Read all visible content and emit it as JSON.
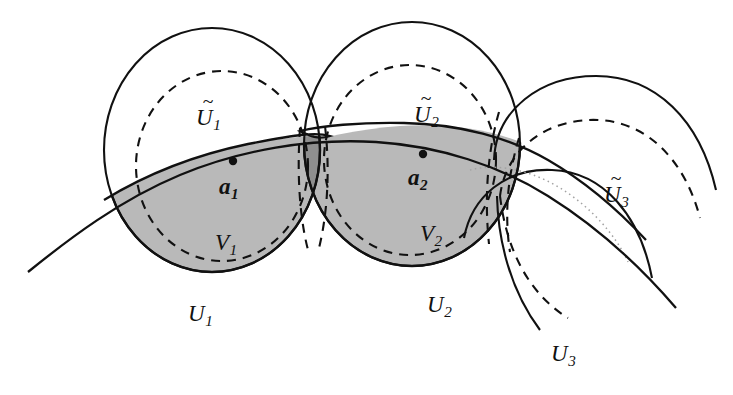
{
  "figure": {
    "background_color": "#ffffff",
    "stroke_color": "#111111",
    "fill_light_gray": "#b9b9b9",
    "fill_dark_gray": "#8e8e8e",
    "dotted_gray": "#9a9a9a"
  },
  "labels": [
    {
      "id": "U1tilde",
      "base": "U",
      "tilde": "~",
      "sub": "1",
      "x": 196,
      "y": 106,
      "has_tilde": true,
      "name": "label-U1-tilde"
    },
    {
      "id": "U2tilde",
      "base": "U",
      "tilde": "~",
      "sub": "2",
      "x": 414,
      "y": 103,
      "has_tilde": true,
      "name": "label-U2-tilde"
    },
    {
      "id": "U3tilde",
      "base": "U",
      "tilde": "~",
      "sub": "3",
      "x": 604,
      "y": 183,
      "has_tilde": true,
      "name": "label-U3-tilde"
    },
    {
      "id": "a1",
      "base": "a",
      "tilde": "",
      "sub": "1",
      "x": 219,
      "y": 175,
      "has_tilde": false,
      "name": "label-a1"
    },
    {
      "id": "a2",
      "base": "a",
      "tilde": "",
      "sub": "2",
      "x": 408,
      "y": 166,
      "has_tilde": false,
      "name": "label-a2"
    },
    {
      "id": "V1",
      "base": "V",
      "tilde": "",
      "sub": "1",
      "x": 215,
      "y": 231,
      "has_tilde": false,
      "name": "label-V1"
    },
    {
      "id": "V2",
      "base": "V",
      "tilde": "",
      "sub": "2",
      "x": 420,
      "y": 222,
      "has_tilde": false,
      "name": "label-V2"
    },
    {
      "id": "U1",
      "base": "U",
      "tilde": "",
      "sub": "1",
      "x": 188,
      "y": 302,
      "has_tilde": false,
      "name": "label-U1"
    },
    {
      "id": "U2",
      "base": "U",
      "tilde": "",
      "sub": "2",
      "x": 427,
      "y": 293,
      "has_tilde": false,
      "name": "label-U2"
    },
    {
      "id": "U3",
      "base": "U",
      "tilde": "",
      "sub": "3",
      "x": 551,
      "y": 342,
      "has_tilde": false,
      "name": "label-U3"
    }
  ],
  "points": [
    {
      "id": "a1",
      "cx": 233,
      "cy": 161,
      "r": 4.2,
      "name": "point-a1"
    },
    {
      "id": "a2",
      "cx": 423,
      "cy": 154,
      "r": 4.2,
      "name": "point-a2"
    }
  ],
  "sets": {
    "U1_tilde_circle": {
      "cx": 212,
      "cy": 150,
      "rx": 108,
      "ry": 122,
      "style": "solid"
    },
    "V1_circle": {
      "cx": 222,
      "cy": 166,
      "rx": 86,
      "ry": 95,
      "style": "dashed"
    },
    "U2_tilde_circle": {
      "cx": 412,
      "cy": 144,
      "rx": 108,
      "ry": 122,
      "style": "solid"
    },
    "V2_circle": {
      "cx": 410,
      "cy": 160,
      "rx": 86,
      "ry": 95,
      "style": "dashed"
    },
    "U3_tilde_arc": {
      "style": "solid",
      "description": "right open arc"
    },
    "V3_arc": {
      "style": "dashed",
      "description": "right open dashed arc"
    },
    "U3_arc": {
      "style": "solid",
      "description": "lower right open arc"
    },
    "manifold_curve": {
      "style": "solid",
      "description": "main sweeping curve through a1 and a2"
    },
    "faint_curve": {
      "style": "dotted",
      "description": "faint dotted curve near U3-tilde label"
    }
  }
}
